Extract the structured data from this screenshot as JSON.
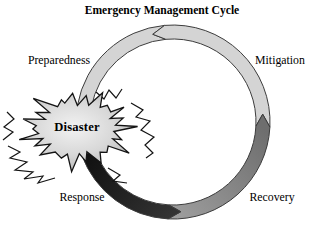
{
  "title": "Emergency Management Cycle",
  "diagram": {
    "center_label": "Disaster",
    "labels": {
      "preparedness": "Preparedness",
      "mitigation": "Mitigation",
      "response": "Response",
      "recovery": "Recovery"
    },
    "flow_direction": "counterclockwise",
    "colors": {
      "background": "#ffffff",
      "text_color": "#000000",
      "light_band": "#d4d4d4",
      "band_outline": "#3c3c3c",
      "recovery_start": "#9e9e9e",
      "recovery_end": "#6e6e6e",
      "response_start": "#101010",
      "response_end": "#333333",
      "burst_center": "#f2f2f2",
      "burst_mid": "#d8d8d8",
      "burst_edge": "#b2b2b2",
      "burst_outline": "#141414"
    },
    "geometry": {
      "cx": 173,
      "cy": 122,
      "outer_r": 97,
      "inner_r": 83,
      "tip_deg": 8
    },
    "segments": [
      {
        "name": "preparedness",
        "a0": -95,
        "a1": -170,
        "start_notch": true,
        "end_tip": false,
        "fill": "light"
      },
      {
        "name": "mitigation",
        "a0": 3,
        "a1": -95,
        "start_notch": true,
        "end_tip": true,
        "fill": "light"
      },
      {
        "name": "recovery",
        "a0": 93,
        "a1": 3,
        "start_notch": true,
        "end_tip": true,
        "fill": "recovery"
      },
      {
        "name": "response",
        "a0": 160,
        "a1": 93,
        "start_notch": false,
        "end_tip": true,
        "fill": "response"
      }
    ]
  }
}
